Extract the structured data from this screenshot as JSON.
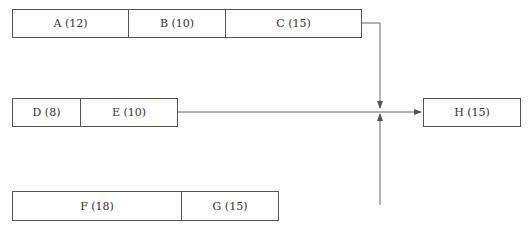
{
  "diagram": {
    "type": "activity-on-arrow network",
    "paths": [
      {
        "name": "path-1",
        "activities": [
          {
            "label": "A (12)"
          },
          {
            "label": "B (10)"
          },
          {
            "label": "C (15)"
          }
        ]
      },
      {
        "name": "path-2",
        "activities": [
          {
            "label": "D (8)"
          },
          {
            "label": "E (10)"
          }
        ]
      },
      {
        "name": "path-3",
        "activities": [
          {
            "label": "F (18)"
          },
          {
            "label": "G (15)"
          }
        ]
      }
    ],
    "final": {
      "label": "H (15)"
    }
  }
}
